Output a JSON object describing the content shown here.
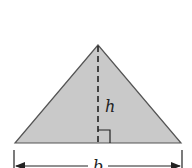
{
  "diagram": {
    "type": "triangle-area",
    "shape": "isosceles triangle",
    "colors": {
      "fill": "#c9c9c9",
      "stroke": "#555555",
      "line": "#222222",
      "background": "#ffffff"
    },
    "labels": {
      "height": "h",
      "base": "b"
    },
    "geometry": {
      "apex": [
        98,
        45
      ],
      "base_left": [
        15,
        143
      ],
      "base_right": [
        181,
        143
      ],
      "altitude_foot": [
        98,
        143
      ]
    }
  }
}
